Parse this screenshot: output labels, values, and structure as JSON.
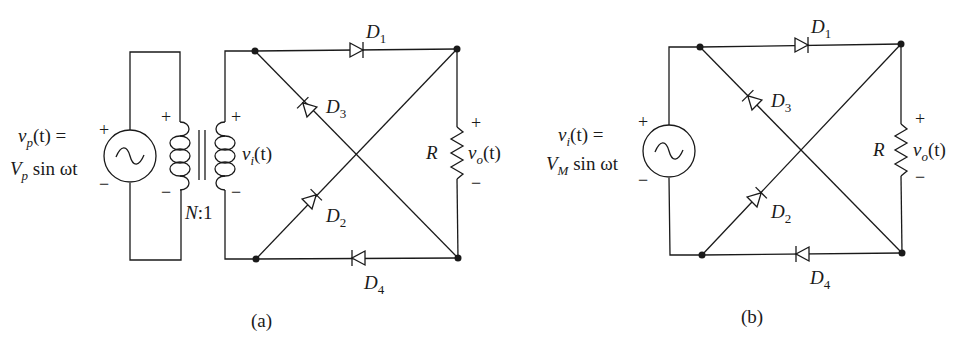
{
  "figure": {
    "panel_a": {
      "caption": "(a)",
      "source_label_line1_var": "v",
      "source_label_line1_sub": "p",
      "source_label_line1_rest": "(t) =",
      "source_label_line2_amp": "V",
      "source_label_line2_sub": "p",
      "source_label_line2_rest": " sin ωt",
      "source_plus": "+",
      "source_minus": "−",
      "primary_plus": "+",
      "primary_minus": "−",
      "secondary_plus": "+",
      "secondary_minus": "−",
      "secondary_label_var": "v",
      "secondary_label_sub": "i",
      "secondary_label_rest": "(t)",
      "turns_ratio_N": "N",
      "turns_ratio_rest": ":1",
      "diodes": [
        {
          "name": "D",
          "sub": "1"
        },
        {
          "name": "D",
          "sub": "2"
        },
        {
          "name": "D",
          "sub": "3"
        },
        {
          "name": "D",
          "sub": "4"
        }
      ],
      "resistor": "R",
      "output_var": "v",
      "output_sub": "o",
      "output_rest": "(t)",
      "output_plus": "+",
      "output_minus": "−"
    },
    "panel_b": {
      "caption": "(b)",
      "source_label_line1_var": "v",
      "source_label_line1_sub": "i",
      "source_label_line1_rest": "(t) =",
      "source_label_line2_amp": "V",
      "source_label_line2_sub": "M",
      "source_label_line2_rest": " sin ωt",
      "source_plus": "+",
      "source_minus": "−",
      "diodes": [
        {
          "name": "D",
          "sub": "1"
        },
        {
          "name": "D",
          "sub": "2"
        },
        {
          "name": "D",
          "sub": "3"
        },
        {
          "name": "D",
          "sub": "4"
        }
      ],
      "resistor": "R",
      "output_var": "v",
      "output_sub": "o",
      "output_rest": "(t)",
      "output_plus": "+",
      "output_minus": "−"
    }
  }
}
